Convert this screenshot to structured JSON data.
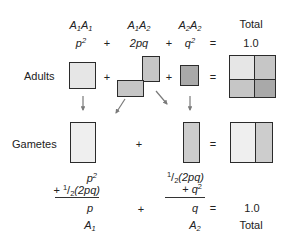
{
  "header": {
    "genotypes": [
      {
        "base1": "A",
        "sub1": "1",
        "base2": "A",
        "sub2": "1"
      },
      {
        "base1": "A",
        "sub1": "1",
        "base2": "A",
        "sub2": "2"
      },
      {
        "base1": "A",
        "sub1": "2",
        "base2": "A",
        "sub2": "2"
      }
    ],
    "total_label": "Total"
  },
  "frequencies": {
    "p2_base": "p",
    "p2_sup": "2",
    "two_pq": "2pq",
    "q2_base": "q",
    "q2_sup": "2",
    "plus": "+",
    "equals": "=",
    "total_value": "1.0"
  },
  "rows": {
    "adults_label": "Adults",
    "gametes_label": "Gametes",
    "plus": "+",
    "equals": "="
  },
  "allele_sums": {
    "a1": {
      "line1_base": "p",
      "line1_sup": "2",
      "line2_prefix": "+ ",
      "line2_num": "1",
      "line2_slash": "/",
      "line2_den": "2",
      "line2_rest": "(2pq)",
      "result": "p",
      "allele_base": "A",
      "allele_sub": "1"
    },
    "a2": {
      "line1_num": "1",
      "line1_slash": "/",
      "line1_den": "2",
      "line1_rest": "(2pq)",
      "line2_prefix": "+ ",
      "line2_base": "q",
      "line2_sup": "2",
      "result": "q",
      "allele_base": "A",
      "allele_sub": "2"
    },
    "plus": "+",
    "equals": "=",
    "total_value": "1.0",
    "total_label": "Total"
  },
  "colors": {
    "a1a1_fill": "#e6e6e6",
    "a1a2_fill": "#c6c6c6",
    "a2a2_fill": "#a9a9a9",
    "a1_gamete_fill": "#efefef",
    "a2_gamete_fill": "#cdcdcd",
    "outline": "#2b2b2b",
    "arrow": "#7a7a7a"
  }
}
